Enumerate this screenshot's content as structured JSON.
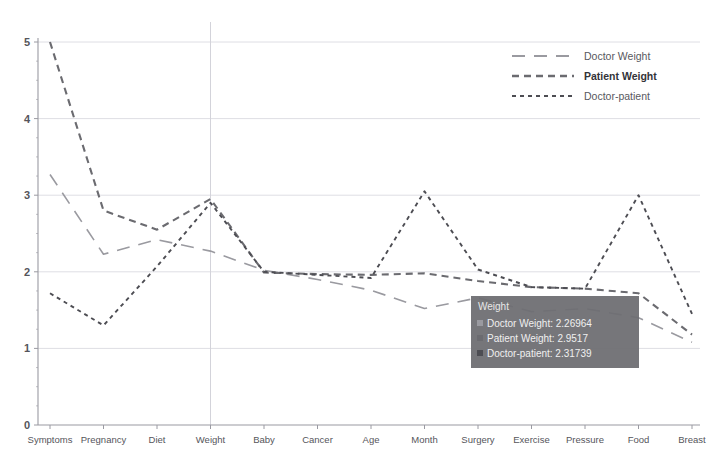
{
  "chart_data": {
    "type": "line",
    "title": "",
    "xlabel": "",
    "ylabel": "",
    "ylim": [
      0,
      5
    ],
    "yticks": [
      0,
      1,
      2,
      3,
      4,
      5
    ],
    "grid": true,
    "legend_position": "top-right",
    "categories": [
      "Symptoms",
      "Pregnancy",
      "Diet",
      "Weight",
      "Baby",
      "Cancer",
      "Age",
      "Month",
      "Surgery",
      "Exercise",
      "Pressure",
      "Food",
      "Breast"
    ],
    "series": [
      {
        "name": "Doctor Weight",
        "style": "long-dash",
        "color": "#9a9aa0",
        "values": [
          3.27,
          2.23,
          2.42,
          2.27,
          2.02,
          1.9,
          1.76,
          1.52,
          1.66,
          1.48,
          1.52,
          1.4,
          1.08
        ]
      },
      {
        "name": "Patient Weight",
        "style": "dash",
        "color": "#6b6b70",
        "values": [
          5.0,
          2.8,
          2.55,
          2.95,
          1.99,
          1.97,
          1.96,
          1.98,
          1.88,
          1.8,
          1.78,
          1.72,
          1.18
        ]
      },
      {
        "name": "Doctor-patient",
        "style": "dotted",
        "color": "#4d4d53",
        "values": [
          1.72,
          1.3,
          2.07,
          2.9,
          2.0,
          1.96,
          1.92,
          3.05,
          2.03,
          1.8,
          1.78,
          3.0,
          1.45
        ]
      }
    ]
  },
  "legend": {
    "items": [
      {
        "label": "Doctor Weight",
        "style": "long-dash"
      },
      {
        "label": "Patient Weight",
        "style": "dash"
      },
      {
        "label": "Doctor-patient",
        "style": "dotted"
      }
    ]
  },
  "tooltip": {
    "title": "Weight",
    "visible": true,
    "rows": [
      {
        "series": "Doctor Weight",
        "value": "2.26964",
        "text": "Doctor Weight: 2.26964"
      },
      {
        "series": "Patient Weight",
        "value": "2.9517",
        "text": "Patient Weight: 2.9517"
      },
      {
        "series": "Doctor-patient",
        "value": "2.31739",
        "text": "Doctor-patient: 2.31739"
      }
    ],
    "hovered_category": "Weight",
    "background_color": "#6d6d72"
  },
  "colors": {
    "background": "#ffffff",
    "axis": "#9a9aa2",
    "grid": "#dedee4",
    "text": "#55555b"
  }
}
